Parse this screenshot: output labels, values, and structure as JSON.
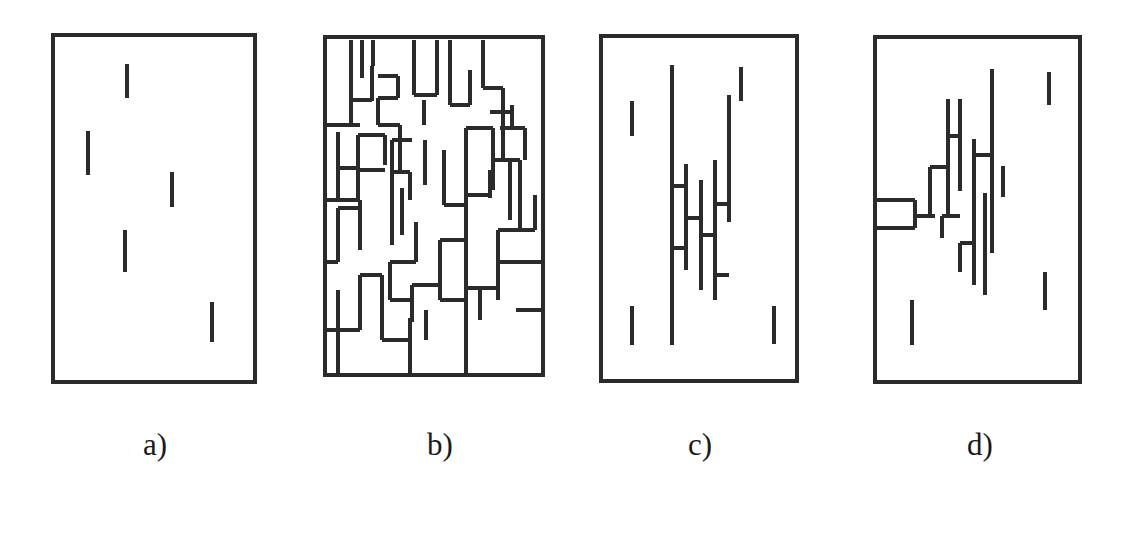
{
  "figure": {
    "width": 1132,
    "height": 544,
    "background": "#ffffff",
    "ink_color": "#2b2b2b",
    "border_stroke_width": 4,
    "segment_stroke_width": 4.2,
    "caption_font_size": 31,
    "caption_baseline_y": 455
  },
  "panels": [
    {
      "id": "panel-a",
      "label": "a)",
      "label_center_x": 155,
      "label_y": 455,
      "box": {
        "x": 53,
        "y": 35,
        "width": 202,
        "height": 347
      },
      "segment_count": 5,
      "cluster": "none",
      "segments": [
        {
          "name": "segment-a-1",
          "x1": 127,
          "y1": 64,
          "x2": 127,
          "y2": 98
        },
        {
          "name": "segment-a-2",
          "x1": 88,
          "y1": 131,
          "x2": 88,
          "y2": 175
        },
        {
          "name": "segment-a-3",
          "x1": 172,
          "y1": 172,
          "x2": 172,
          "y2": 207
        },
        {
          "name": "segment-a-4",
          "x1": 125,
          "y1": 230,
          "x2": 125,
          "y2": 272
        },
        {
          "name": "segment-a-5",
          "x1": 212,
          "y1": 302,
          "x2": 212,
          "y2": 342
        }
      ]
    },
    {
      "id": "panel-b",
      "label": "b)",
      "label_center_x": 440,
      "label_y": 455,
      "box": {
        "x": 325,
        "y": 37,
        "width": 218,
        "height": 338
      },
      "segment_count": 70,
      "cluster": "percolating-maze",
      "segments": [
        {
          "name": "seg-b-v-1",
          "x1": 351,
          "y1": 40,
          "x2": 351,
          "y2": 100
        },
        {
          "name": "seg-b-v-2",
          "x1": 362,
          "y1": 40,
          "x2": 362,
          "y2": 78
        },
        {
          "name": "seg-b-h-1",
          "x1": 351,
          "y1": 100,
          "x2": 372,
          "y2": 100
        },
        {
          "name": "seg-b-v-3",
          "x1": 372,
          "y1": 66,
          "x2": 372,
          "y2": 101
        },
        {
          "name": "seg-b-v-4",
          "x1": 351,
          "y1": 100,
          "x2": 351,
          "y2": 125
        },
        {
          "name": "seg-b-h-2",
          "x1": 325,
          "y1": 125,
          "x2": 360,
          "y2": 125
        },
        {
          "name": "seg-b-h-3",
          "x1": 378,
          "y1": 76,
          "x2": 398,
          "y2": 76
        },
        {
          "name": "seg-b-v-5",
          "x1": 398,
          "y1": 76,
          "x2": 398,
          "y2": 98
        },
        {
          "name": "seg-b-h-4",
          "x1": 378,
          "y1": 98,
          "x2": 398,
          "y2": 98
        },
        {
          "name": "seg-b-v-6",
          "x1": 378,
          "y1": 98,
          "x2": 378,
          "y2": 125
        },
        {
          "name": "seg-b-h-5",
          "x1": 378,
          "y1": 125,
          "x2": 400,
          "y2": 125
        },
        {
          "name": "seg-b-v-7",
          "x1": 400,
          "y1": 125,
          "x2": 400,
          "y2": 170
        },
        {
          "name": "seg-b-v-8",
          "x1": 414,
          "y1": 40,
          "x2": 414,
          "y2": 95
        },
        {
          "name": "seg-b-h-6",
          "x1": 414,
          "y1": 95,
          "x2": 437,
          "y2": 95
        },
        {
          "name": "seg-b-v-9",
          "x1": 437,
          "y1": 40,
          "x2": 437,
          "y2": 95
        },
        {
          "name": "seg-b-v-10",
          "x1": 424,
          "y1": 100,
          "x2": 424,
          "y2": 125
        },
        {
          "name": "seg-b-v-11",
          "x1": 450,
          "y1": 40,
          "x2": 450,
          "y2": 105
        },
        {
          "name": "seg-b-h-7",
          "x1": 450,
          "y1": 105,
          "x2": 470,
          "y2": 105
        },
        {
          "name": "seg-b-v-12",
          "x1": 470,
          "y1": 70,
          "x2": 470,
          "y2": 105
        },
        {
          "name": "seg-b-v-13",
          "x1": 483,
          "y1": 40,
          "x2": 483,
          "y2": 88
        },
        {
          "name": "seg-b-h-8",
          "x1": 483,
          "y1": 88,
          "x2": 503,
          "y2": 88
        },
        {
          "name": "seg-b-v-14",
          "x1": 503,
          "y1": 88,
          "x2": 503,
          "y2": 112
        },
        {
          "name": "seg-b-h-9",
          "x1": 490,
          "y1": 112,
          "x2": 512,
          "y2": 112
        },
        {
          "name": "seg-b-v-15",
          "x1": 512,
          "y1": 105,
          "x2": 512,
          "y2": 128
        },
        {
          "name": "seg-b-h-10",
          "x1": 500,
          "y1": 128,
          "x2": 525,
          "y2": 128
        },
        {
          "name": "seg-b-v-16",
          "x1": 503,
          "y1": 112,
          "x2": 503,
          "y2": 160
        },
        {
          "name": "seg-b-v-17",
          "x1": 525,
          "y1": 128,
          "x2": 525,
          "y2": 160
        },
        {
          "name": "seg-b-v-18",
          "x1": 493,
          "y1": 128,
          "x2": 493,
          "y2": 190
        },
        {
          "name": "seg-b-h-11",
          "x1": 466,
          "y1": 128,
          "x2": 493,
          "y2": 128
        },
        {
          "name": "seg-b-v-19",
          "x1": 466,
          "y1": 128,
          "x2": 466,
          "y2": 195
        },
        {
          "name": "seg-b-h-12",
          "x1": 338,
          "y1": 132,
          "x2": 338,
          "y2": 168
        },
        {
          "name": "seg-b-h-13",
          "x1": 338,
          "y1": 168,
          "x2": 358,
          "y2": 168
        },
        {
          "name": "seg-b-v-20",
          "x1": 358,
          "y1": 135,
          "x2": 358,
          "y2": 200
        },
        {
          "name": "seg-b-h-14",
          "x1": 358,
          "y1": 135,
          "x2": 385,
          "y2": 135
        },
        {
          "name": "seg-b-v-21",
          "x1": 385,
          "y1": 135,
          "x2": 385,
          "y2": 165
        },
        {
          "name": "seg-b-h-15",
          "x1": 392,
          "y1": 140,
          "x2": 412,
          "y2": 140
        },
        {
          "name": "seg-b-v-22",
          "x1": 392,
          "y1": 140,
          "x2": 392,
          "y2": 180
        },
        {
          "name": "seg-b-v-23",
          "x1": 425,
          "y1": 140,
          "x2": 425,
          "y2": 185
        },
        {
          "name": "seg-b-h-16",
          "x1": 358,
          "y1": 170,
          "x2": 385,
          "y2": 170
        },
        {
          "name": "seg-b-v-24",
          "x1": 338,
          "y1": 168,
          "x2": 338,
          "y2": 200
        },
        {
          "name": "seg-b-h-17",
          "x1": 325,
          "y1": 200,
          "x2": 360,
          "y2": 200
        },
        {
          "name": "seg-b-v-25",
          "x1": 360,
          "y1": 200,
          "x2": 360,
          "y2": 250
        },
        {
          "name": "seg-b-h-18",
          "x1": 338,
          "y1": 208,
          "x2": 360,
          "y2": 208
        },
        {
          "name": "seg-b-v-26",
          "x1": 338,
          "y1": 208,
          "x2": 338,
          "y2": 262
        },
        {
          "name": "seg-b-h-19",
          "x1": 325,
          "y1": 262,
          "x2": 338,
          "y2": 262
        },
        {
          "name": "seg-b-v-27",
          "x1": 392,
          "y1": 172,
          "x2": 392,
          "y2": 245
        },
        {
          "name": "seg-b-h-20",
          "x1": 392,
          "y1": 172,
          "x2": 410,
          "y2": 172
        },
        {
          "name": "seg-b-v-28",
          "x1": 410,
          "y1": 172,
          "x2": 410,
          "y2": 200
        },
        {
          "name": "seg-b-v-29",
          "x1": 402,
          "y1": 188,
          "x2": 402,
          "y2": 235
        },
        {
          "name": "seg-b-v-30",
          "x1": 444,
          "y1": 150,
          "x2": 444,
          "y2": 205
        },
        {
          "name": "seg-b-h-21",
          "x1": 444,
          "y1": 205,
          "x2": 466,
          "y2": 205
        },
        {
          "name": "seg-b-v-31",
          "x1": 466,
          "y1": 195,
          "x2": 466,
          "y2": 240
        },
        {
          "name": "seg-b-h-22",
          "x1": 466,
          "y1": 195,
          "x2": 490,
          "y2": 195
        },
        {
          "name": "seg-b-v-32",
          "x1": 490,
          "y1": 170,
          "x2": 490,
          "y2": 198
        },
        {
          "name": "seg-b-v-33",
          "x1": 510,
          "y1": 160,
          "x2": 510,
          "y2": 220
        },
        {
          "name": "seg-b-h-23",
          "x1": 495,
          "y1": 160,
          "x2": 520,
          "y2": 160
        },
        {
          "name": "seg-b-v-34",
          "x1": 520,
          "y1": 160,
          "x2": 520,
          "y2": 230
        },
        {
          "name": "seg-b-h-24",
          "x1": 498,
          "y1": 230,
          "x2": 535,
          "y2": 230
        },
        {
          "name": "seg-b-v-35",
          "x1": 535,
          "y1": 195,
          "x2": 535,
          "y2": 230
        },
        {
          "name": "seg-b-v-36",
          "x1": 498,
          "y1": 230,
          "x2": 498,
          "y2": 262
        },
        {
          "name": "seg-b-h-25",
          "x1": 498,
          "y1": 262,
          "x2": 543,
          "y2": 262
        },
        {
          "name": "seg-b-v-37",
          "x1": 416,
          "y1": 222,
          "x2": 416,
          "y2": 262
        },
        {
          "name": "seg-b-h-26",
          "x1": 390,
          "y1": 262,
          "x2": 416,
          "y2": 262
        },
        {
          "name": "seg-b-v-38",
          "x1": 390,
          "y1": 262,
          "x2": 390,
          "y2": 300
        },
        {
          "name": "seg-b-h-27",
          "x1": 390,
          "y1": 300,
          "x2": 412,
          "y2": 300
        },
        {
          "name": "seg-b-v-39",
          "x1": 412,
          "y1": 285,
          "x2": 412,
          "y2": 322
        },
        {
          "name": "seg-b-h-28",
          "x1": 412,
          "y1": 285,
          "x2": 440,
          "y2": 285
        },
        {
          "name": "seg-b-v-40",
          "x1": 440,
          "y1": 240,
          "x2": 440,
          "y2": 300
        },
        {
          "name": "seg-b-h-29",
          "x1": 440,
          "y1": 240,
          "x2": 466,
          "y2": 240
        },
        {
          "name": "seg-b-v-41",
          "x1": 466,
          "y1": 240,
          "x2": 466,
          "y2": 325
        },
        {
          "name": "seg-b-h-30",
          "x1": 466,
          "y1": 288,
          "x2": 500,
          "y2": 288
        },
        {
          "name": "seg-b-v-42",
          "x1": 480,
          "y1": 288,
          "x2": 480,
          "y2": 320
        },
        {
          "name": "seg-b-h-31",
          "x1": 516,
          "y1": 310,
          "x2": 543,
          "y2": 310
        },
        {
          "name": "seg-b-v-43",
          "x1": 360,
          "y1": 275,
          "x2": 360,
          "y2": 330
        },
        {
          "name": "seg-b-h-32",
          "x1": 360,
          "y1": 275,
          "x2": 382,
          "y2": 275
        },
        {
          "name": "seg-b-v-44",
          "x1": 382,
          "y1": 275,
          "x2": 382,
          "y2": 340
        },
        {
          "name": "seg-b-h-33",
          "x1": 382,
          "y1": 340,
          "x2": 410,
          "y2": 340
        },
        {
          "name": "seg-b-v-45",
          "x1": 410,
          "y1": 318,
          "x2": 410,
          "y2": 375
        },
        {
          "name": "seg-b-v-46",
          "x1": 338,
          "y1": 290,
          "x2": 338,
          "y2": 375
        },
        {
          "name": "seg-b-h-34",
          "x1": 325,
          "y1": 330,
          "x2": 360,
          "y2": 330
        },
        {
          "name": "seg-b-v-47",
          "x1": 466,
          "y1": 325,
          "x2": 466,
          "y2": 375
        },
        {
          "name": "seg-b-h-35",
          "x1": 440,
          "y1": 300,
          "x2": 468,
          "y2": 300
        },
        {
          "name": "seg-b-v-48",
          "x1": 498,
          "y1": 262,
          "x2": 498,
          "y2": 300
        },
        {
          "name": "seg-b-v-49",
          "x1": 426,
          "y1": 310,
          "x2": 426,
          "y2": 340
        },
        {
          "name": "seg-b-v-50",
          "x1": 373,
          "y1": 40,
          "x2": 373,
          "y2": 66
        }
      ]
    },
    {
      "id": "panel-c",
      "label": "c)",
      "label_center_x": 700,
      "label_y": 455,
      "box": {
        "x": 601,
        "y": 36,
        "width": 196,
        "height": 345
      },
      "segment_count": 16,
      "cluster": "central-connected-cluster",
      "segments": [
        {
          "name": "segment-c-iso-1",
          "x1": 632,
          "y1": 101,
          "x2": 632,
          "y2": 136
        },
        {
          "name": "segment-c-iso-2",
          "x1": 741,
          "y1": 67,
          "x2": 741,
          "y2": 101
        },
        {
          "name": "segment-c-iso-3",
          "x1": 632,
          "y1": 306,
          "x2": 632,
          "y2": 345
        },
        {
          "name": "segment-c-iso-4",
          "x1": 774,
          "y1": 306,
          "x2": 774,
          "y2": 344
        },
        {
          "name": "segment-c-v-main",
          "x1": 672,
          "y1": 65,
          "x2": 672,
          "y2": 345
        },
        {
          "name": "segment-c-v-b",
          "x1": 686,
          "y1": 164,
          "x2": 686,
          "y2": 270
        },
        {
          "name": "segment-c-h-1",
          "x1": 672,
          "y1": 186,
          "x2": 686,
          "y2": 186
        },
        {
          "name": "segment-c-h-2",
          "x1": 672,
          "y1": 248,
          "x2": 686,
          "y2": 248
        },
        {
          "name": "segment-c-v-c",
          "x1": 701,
          "y1": 180,
          "x2": 701,
          "y2": 290
        },
        {
          "name": "segment-c-h-3",
          "x1": 686,
          "y1": 218,
          "x2": 701,
          "y2": 218
        },
        {
          "name": "segment-c-v-d",
          "x1": 715,
          "y1": 160,
          "x2": 715,
          "y2": 297
        },
        {
          "name": "segment-c-h-4",
          "x1": 701,
          "y1": 235,
          "x2": 715,
          "y2": 235
        },
        {
          "name": "segment-c-v-e",
          "x1": 729,
          "y1": 95,
          "x2": 729,
          "y2": 222
        },
        {
          "name": "segment-c-h-5",
          "x1": 715,
          "y1": 204,
          "x2": 729,
          "y2": 204
        },
        {
          "name": "segment-c-v-f",
          "x1": 715,
          "y1": 230,
          "x2": 715,
          "y2": 275
        },
        {
          "name": "segment-c-h-6",
          "x1": 715,
          "y1": 275,
          "x2": 729,
          "y2": 275
        },
        {
          "name": "segment-c-v-g",
          "x1": 715,
          "y1": 275,
          "x2": 715,
          "y2": 300
        }
      ]
    },
    {
      "id": "panel-d",
      "label": "d)",
      "label_center_x": 980,
      "label_y": 455,
      "box": {
        "x": 875,
        "y": 37,
        "width": 205,
        "height": 345
      },
      "segment_count": 20,
      "cluster": "cluster-touching-left-boundary",
      "segments": [
        {
          "name": "segment-d-iso-1",
          "x1": 1049,
          "y1": 72,
          "x2": 1049,
          "y2": 105
        },
        {
          "name": "segment-d-iso-2",
          "x1": 1003,
          "y1": 166,
          "x2": 1003,
          "y2": 197
        },
        {
          "name": "segment-d-iso-3",
          "x1": 1045,
          "y1": 272,
          "x2": 1045,
          "y2": 310
        },
        {
          "name": "segment-d-iso-4",
          "x1": 912,
          "y1": 300,
          "x2": 912,
          "y2": 345
        },
        {
          "name": "segment-d-v-tall",
          "x1": 992,
          "y1": 69,
          "x2": 992,
          "y2": 253
        },
        {
          "name": "segment-d-v-a",
          "x1": 948,
          "y1": 99,
          "x2": 948,
          "y2": 215
        },
        {
          "name": "segment-d-v-b",
          "x1": 960,
          "y1": 99,
          "x2": 960,
          "y2": 191
        },
        {
          "name": "segment-d-h-1",
          "x1": 948,
          "y1": 136,
          "x2": 960,
          "y2": 136
        },
        {
          "name": "segment-d-v-c",
          "x1": 974,
          "y1": 139,
          "x2": 974,
          "y2": 258
        },
        {
          "name": "segment-d-h-2",
          "x1": 974,
          "y1": 155,
          "x2": 992,
          "y2": 155
        },
        {
          "name": "segment-d-v-d",
          "x1": 974,
          "y1": 196,
          "x2": 974,
          "y2": 285
        },
        {
          "name": "segment-d-h-3",
          "x1": 960,
          "y1": 243,
          "x2": 974,
          "y2": 243
        },
        {
          "name": "segment-d-v-e",
          "x1": 960,
          "y1": 243,
          "x2": 960,
          "y2": 272
        },
        {
          "name": "segment-d-v-f",
          "x1": 985,
          "y1": 193,
          "x2": 985,
          "y2": 295
        },
        {
          "name": "segment-d-stair-v1",
          "x1": 930,
          "y1": 167,
          "x2": 930,
          "y2": 216
        },
        {
          "name": "segment-d-stair-h1",
          "x1": 930,
          "y1": 167,
          "x2": 948,
          "y2": 167
        },
        {
          "name": "segment-d-stair-h2",
          "x1": 915,
          "y1": 216,
          "x2": 935,
          "y2": 216
        },
        {
          "name": "segment-d-stair-v2",
          "x1": 915,
          "y1": 200,
          "x2": 915,
          "y2": 216
        },
        {
          "name": "segment-d-stair-h3",
          "x1": 875,
          "y1": 200,
          "x2": 915,
          "y2": 200
        },
        {
          "name": "segment-d-stair-v3",
          "x1": 915,
          "y1": 216,
          "x2": 915,
          "y2": 228
        },
        {
          "name": "segment-d-stair-h4",
          "x1": 875,
          "y1": 228,
          "x2": 915,
          "y2": 228
        },
        {
          "name": "segment-d-v-g",
          "x1": 942,
          "y1": 216,
          "x2": 942,
          "y2": 238
        },
        {
          "name": "segment-d-h-4",
          "x1": 942,
          "y1": 216,
          "x2": 960,
          "y2": 216
        }
      ]
    }
  ]
}
